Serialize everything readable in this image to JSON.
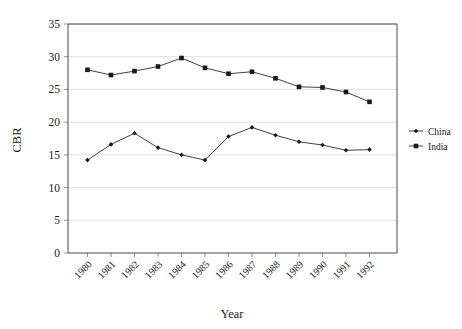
{
  "chart_data": {
    "type": "line",
    "title": "",
    "xlabel": "Year",
    "ylabel": "CBR",
    "x": [
      1980,
      1981,
      1982,
      1983,
      1984,
      1985,
      1986,
      1987,
      1988,
      1989,
      1990,
      1991,
      1992
    ],
    "categories": [
      "1980",
      "1981",
      "1982",
      "1983",
      "1984",
      "1985",
      "1986",
      "1987",
      "1988",
      "1989",
      "1990",
      "1991",
      "1992"
    ],
    "series": [
      {
        "name": "China",
        "marker": "diamond",
        "color": "#1a1a1a",
        "values": [
          14.2,
          16.6,
          18.3,
          16.1,
          15.0,
          14.2,
          17.8,
          19.2,
          18.0,
          17.0,
          16.5,
          15.7,
          15.8
        ]
      },
      {
        "name": "India",
        "marker": "square",
        "color": "#1a1a1a",
        "values": [
          28.0,
          27.2,
          27.8,
          28.5,
          29.8,
          28.3,
          27.4,
          27.7,
          26.7,
          25.4,
          25.3,
          24.6,
          23.1
        ]
      }
    ],
    "ylim": [
      0,
      35
    ],
    "yticks": [
      0,
      5,
      10,
      15,
      20,
      25,
      30,
      35
    ],
    "ytick_labels": [
      "0",
      "5",
      "10",
      "15",
      "20",
      "25",
      "30",
      "35"
    ],
    "grid": true,
    "grid_axis": "y",
    "legend_position": "right",
    "legend_entries": [
      "China",
      "India"
    ],
    "xtick_rotation": 45
  },
  "axes": {
    "y_title": "CBR",
    "x_title": "Year"
  },
  "legend": {
    "items": [
      {
        "label": "China",
        "marker": "diamond"
      },
      {
        "label": "India",
        "marker": "square"
      }
    ]
  }
}
